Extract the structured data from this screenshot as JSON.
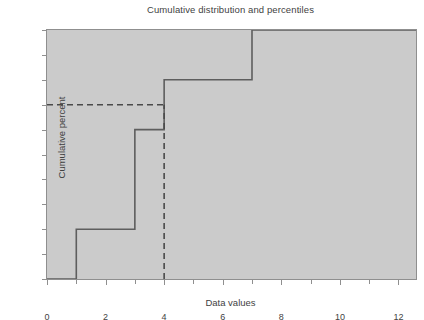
{
  "chart_data": {
    "type": "line",
    "title": "Cumulative distribution and percentiles",
    "xlabel": "Data values",
    "ylabel": "Cumulative percent",
    "xlim": [
      0,
      12.6
    ],
    "ylim": [
      0,
      100
    ],
    "grid": false,
    "legend": "none",
    "x_ticks": [
      0,
      2,
      4,
      6,
      8,
      10,
      12
    ],
    "x_tick_labels": [
      "0",
      "2",
      "4",
      "6",
      "8",
      "10",
      "12"
    ],
    "x_minor_ticks": [
      1,
      3,
      5,
      7,
      9,
      11
    ],
    "y_ticks": [
      0,
      10,
      20,
      30,
      40,
      50,
      60,
      70,
      80,
      90,
      100
    ],
    "y_tick_labels": [
      "0%",
      "10%",
      "20%",
      "30%",
      "40%",
      "50%",
      "60%",
      "70%",
      "80%",
      "90%",
      "100%"
    ],
    "series": [
      {
        "name": "Cumulative distribution",
        "style": "step-post",
        "color": "#5e5e5e",
        "x": [
          0,
          1,
          1,
          3,
          3,
          4,
          4,
          7,
          7,
          12.6
        ],
        "y": [
          0,
          0,
          20,
          20,
          60,
          60,
          80,
          80,
          100,
          100
        ],
        "steps": [
          {
            "x_start": 0,
            "x_end": 1,
            "percent": 0
          },
          {
            "x_start": 1,
            "x_end": 3,
            "percent": 20
          },
          {
            "x_start": 3,
            "x_end": 4,
            "percent": 60
          },
          {
            "x_start": 4,
            "x_end": 7,
            "percent": 80
          },
          {
            "x_start": 7,
            "x_end": 12.6,
            "percent": 100
          }
        ]
      }
    ],
    "annotations": [
      {
        "name": "percentile-horizontal-guide",
        "style": "dashed",
        "color": "#4a4a4a",
        "orientation": "horizontal",
        "percent": 70,
        "x_start": 0,
        "x_end": 4
      },
      {
        "name": "percentile-vertical-guide",
        "style": "dashed",
        "color": "#4a4a4a",
        "orientation": "vertical",
        "data_value": 4,
        "percent_start": 0,
        "percent_end": 70
      }
    ],
    "colors": {
      "plot_background": "#cbcbcb",
      "figure_background": "#ffffff",
      "axis": "#8f8f8f",
      "text": "#3f3f3f",
      "line": "#5e5e5e",
      "dashed": "#4a4a4a"
    }
  }
}
